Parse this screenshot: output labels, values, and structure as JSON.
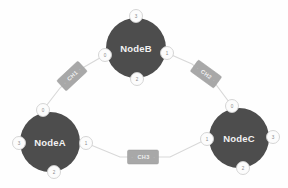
{
  "diagram": {
    "type": "network-topology",
    "title": "",
    "background_color": "#fefefe",
    "node_color": "#4d4d4d",
    "node_text_color": "#f2f2f2",
    "edge_color": "#d8d8d8",
    "port_fill_color": "#fcfcfc",
    "port_text_color": "#8a8a8a",
    "channel_box_color": "#a8a8a8",
    "channel_text_color": "#f0f0f0"
  },
  "nodes": [
    {
      "id": "NodeB",
      "label": "NodeB",
      "cx": 136,
      "cy": 48,
      "r": 30,
      "ports": [
        {
          "name": "port-top",
          "label": "3",
          "cx": 136,
          "cy": 16,
          "r": 6.5
        },
        {
          "name": "port-left",
          "label": "0",
          "cx": 105,
          "cy": 55,
          "r": 6.5
        },
        {
          "name": "port-right",
          "label": "1",
          "cx": 167,
          "cy": 53,
          "r": 6.5
        },
        {
          "name": "port-bottom",
          "label": "2",
          "cx": 137,
          "cy": 79,
          "r": 6.5
        }
      ]
    },
    {
      "id": "NodeA",
      "label": "NodeA",
      "cx": 50,
      "cy": 142,
      "r": 30,
      "ports": [
        {
          "name": "port-top",
          "label": "0",
          "cx": 43,
          "cy": 110,
          "r": 6.5
        },
        {
          "name": "port-right",
          "label": "1",
          "cx": 86,
          "cy": 143,
          "r": 6.5
        },
        {
          "name": "port-bottom",
          "label": "2",
          "cx": 54,
          "cy": 172,
          "r": 6.5
        },
        {
          "name": "port-left",
          "label": "3",
          "cx": 19,
          "cy": 143,
          "r": 6.5
        }
      ]
    },
    {
      "id": "NodeC",
      "label": "NodeC",
      "cx": 239,
      "cy": 138,
      "r": 30,
      "ports": [
        {
          "name": "port-top",
          "label": "0",
          "cx": 232,
          "cy": 106,
          "r": 6.5
        },
        {
          "name": "port-left",
          "label": "1",
          "cx": 207,
          "cy": 139,
          "r": 6.5
        },
        {
          "name": "port-right",
          "label": "3",
          "cx": 273,
          "cy": 137,
          "r": 6.5
        },
        {
          "name": "port-bottom",
          "label": "2",
          "cx": 243,
          "cy": 168,
          "r": 6.5
        }
      ]
    }
  ],
  "links": [
    {
      "id": "CH1",
      "label": "CH1",
      "from_node": "NodeA",
      "from_port": "0",
      "to_node": "NodeB",
      "to_port": "0",
      "path": "M 43 110 L 60 88 L 79 70 L 105 55",
      "label_x": 72,
      "label_y": 76,
      "label_rotation": -43,
      "box_w": 29,
      "box_h": 14
    },
    {
      "id": "CH2",
      "label": "CH2",
      "from_node": "NodeB",
      "from_port": "1",
      "to_node": "NodeC",
      "to_port": "0",
      "path": "M 167 53 L 192 64 L 214 82 L 232 106",
      "label_x": 206,
      "label_y": 74,
      "label_rotation": 36,
      "box_w": 29,
      "box_h": 14
    },
    {
      "id": "CH3",
      "label": "CH3",
      "from_node": "NodeA",
      "from_port": "1",
      "to_node": "NodeC",
      "to_port": "1",
      "path": "M 86 143 L 120 157 L 170 157 L 207 139",
      "label_x": 143,
      "label_y": 157,
      "label_rotation": 0,
      "box_w": 31,
      "box_h": 14
    }
  ],
  "channel_tick": "·"
}
